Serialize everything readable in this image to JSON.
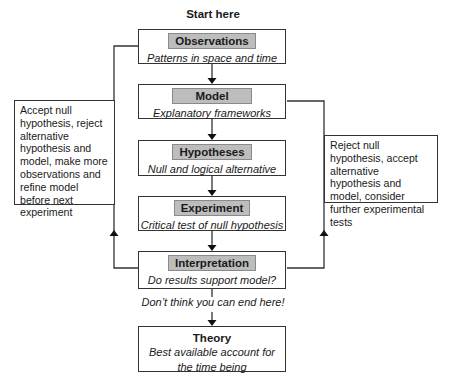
{
  "diagram": {
    "start_label": "Start here",
    "steps": [
      {
        "title": "Observations",
        "subtitle": "Patterns in space and time"
      },
      {
        "title": "Model",
        "subtitle": "Explanatory frameworks"
      },
      {
        "title": "Hypotheses",
        "subtitle": "Null and logical alternative"
      },
      {
        "title": "Experiment",
        "subtitle": "Critical test of null hypothesis"
      },
      {
        "title": "Interpretation",
        "subtitle": "Do results support model?"
      }
    ],
    "end_note": "Don’t think you can end here!",
    "theory": {
      "title": "Theory",
      "subtitle_line1": "Best available account for",
      "subtitle_line2": "the time being"
    },
    "left_loop_note": "Accept null hypothesis, reject alternative hypothesis and model, make more observations and refine model before next experiment",
    "right_loop_note": "Reject null hypothesis, accept alternative hypothesis and model, consider further experimental tests",
    "colors": {
      "line": "#333333",
      "label_fill": "#bdbdbd",
      "label_border": "#8a8a8a"
    }
  }
}
